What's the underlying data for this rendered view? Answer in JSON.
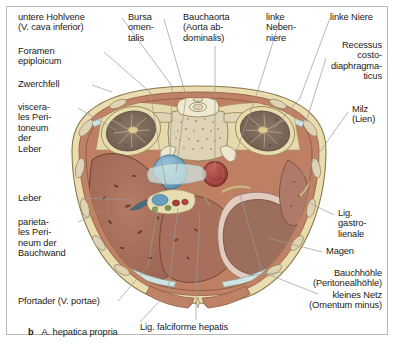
{
  "figure": {
    "panel_letter": "b",
    "kind": "anatomical-cross-section",
    "region": "Oberbauch Transversalschnitt",
    "language": "de"
  },
  "labels": {
    "vena_cava": "untere Hohlvene\n(V. cava inferior)",
    "foramen_epiploicum": "Foramen\nepiploicum",
    "zwerchfell": "Zwerchfell",
    "viscerales_peritoneum": "viscera-\nles Peri-\ntoneum\nder\nLeber",
    "leber": "Leber",
    "parietales_peritoneum": "parieta-\nles Peri-\nneum der\nBauchwand",
    "pfortader": "Pfortader (V. portae)",
    "a_hepatica": "A. hepatica propria",
    "bursa_omentalis": "Bursa\nomen-\ntalis",
    "bauchaorta": "Bauchaorta\n(Aorta ab-\ndominalis)",
    "linke_nebenniere": "linke\nNeben-\nniere",
    "linke_niere": "linke Niere",
    "recessus": "Recessus\ncosto-\ndiaphragma-\nticus",
    "milz": "Milz\n(Lien)",
    "lig_gastrolienale": "Lig.\ngastro-\nlienale",
    "magen": "Magen",
    "bauchhoehle": "Bauchhöhle\n(Peritonealhöhle)",
    "kleines_netz": "kleines Netz\n(Omentum minus)",
    "lig_falciforme": "Lig. falciforme hepatis"
  },
  "colors": {
    "body_wall_fat": "#e9dcaf",
    "muscle": "#c08265",
    "liver": "#a8705c",
    "stomach": "#9c6f5c",
    "stomach_mucosa": "#e3cbc0",
    "kidney": "#7d6b5c",
    "vertebra": "#ded3b4",
    "ivc_blue": "#6a9ec0",
    "aorta_red": "#a8403a",
    "spleen": "#b07a6a",
    "peritoneal_cavity": "#cfe4e2",
    "leader_line": "#9a9a9a",
    "frame": "#b9b9b9",
    "text": "#1a1a1a"
  }
}
